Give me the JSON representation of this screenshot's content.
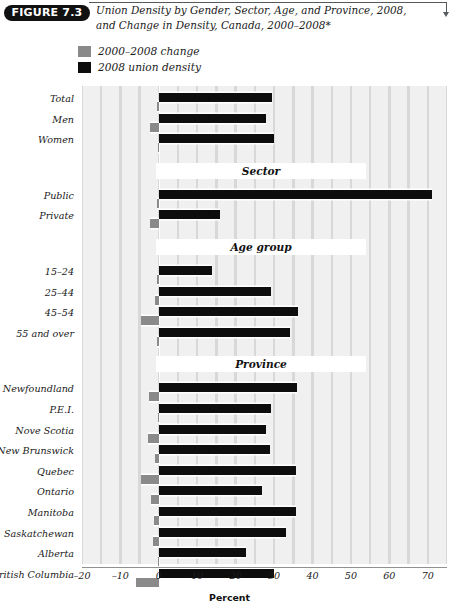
{
  "figure": {
    "badge": "FIGURE 7.3",
    "title": "Union Density by Gender, Sector, Age, and Province, 2008, and Change in Density, Canada, 2000–2008*"
  },
  "legend": {
    "position": "top-left",
    "items": [
      {
        "label": "2000–2008 change",
        "color": "#8a8a8a",
        "swatch": "gray-swatch"
      },
      {
        "label": "2008 union density",
        "color": "#0d0d0d",
        "swatch": "black-swatch"
      }
    ]
  },
  "chart_data": {
    "type": "bar",
    "orientation": "horizontal",
    "title": "Union Density by Gender, Sector, Age, and Province, 2008, and Change in Density, Canada, 2000–2008*",
    "xlabel": "Percent",
    "ylabel": "",
    "xlim": [
      -20,
      75
    ],
    "xticks": [
      -20,
      -10,
      0,
      10,
      20,
      30,
      40,
      50,
      60,
      70
    ],
    "xticklabels": [
      "–20",
      "–10",
      "0",
      "10",
      "20",
      "30",
      "40",
      "50",
      "60",
      "70"
    ],
    "grid": "vertical-banded",
    "series": [
      {
        "name": "2000–2008 change",
        "color": "#8a8a8a"
      },
      {
        "name": "2008 union density",
        "color": "#0d0d0d"
      }
    ],
    "sections": [
      {
        "heading": "",
        "rows": [
          {
            "category": "Total",
            "density": 29.4,
            "change": -0.6
          },
          {
            "category": "Men",
            "density": 28.0,
            "change": -2.4
          },
          {
            "category": "Women",
            "density": 30.1,
            "change": -0.3
          }
        ]
      },
      {
        "heading": "Sector",
        "rows": [
          {
            "category": "Public",
            "density": 71.0,
            "change": -0.5
          },
          {
            "category": "Private",
            "density": 16.0,
            "change": -2.2
          }
        ]
      },
      {
        "heading": "Age group",
        "rows": [
          {
            "category": "15–24",
            "density": 13.9,
            "change": -0.4
          },
          {
            "category": "25–44",
            "density": 29.3,
            "change": -1.0
          },
          {
            "category": "45–54",
            "density": 36.2,
            "change": -4.6
          },
          {
            "category": "55 and over",
            "density": 34.1,
            "change": -0.4
          }
        ]
      },
      {
        "heading": "Province",
        "rows": [
          {
            "category": "Newfoundland",
            "density": 36.0,
            "change": -2.6
          },
          {
            "category": "P.E.I.",
            "density": 29.2,
            "change": -0.3
          },
          {
            "category": "Nove Scotia",
            "density": 27.8,
            "change": -2.8
          },
          {
            "category": "New Brunswick",
            "density": 29.0,
            "change": -1.0
          },
          {
            "category": "Quebec",
            "density": 35.6,
            "change": -4.6
          },
          {
            "category": "Ontario",
            "density": 26.8,
            "change": -2.0
          },
          {
            "category": "Manitoba",
            "density": 35.8,
            "change": -1.2
          },
          {
            "category": "Saskatchewan",
            "density": 33.0,
            "change": -1.4
          },
          {
            "category": "Alberta",
            "density": 22.8,
            "change": -0.3
          },
          {
            "category": "British Columbia",
            "density": 30.1,
            "change": -6.0
          }
        ]
      }
    ]
  }
}
